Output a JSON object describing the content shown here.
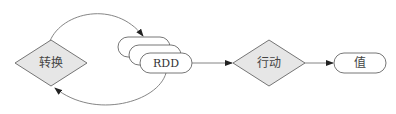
{
  "diagram": {
    "type": "flowchart",
    "nodes": {
      "transform": {
        "label": "转换",
        "shape": "diamond"
      },
      "rdd": {
        "label": "RDD",
        "shape": "stacked-pill"
      },
      "action": {
        "label": "行动",
        "shape": "diamond"
      },
      "value": {
        "label": "值",
        "shape": "pill"
      }
    },
    "edges": [
      {
        "from": "transform",
        "to": "rdd",
        "style": "curved-top"
      },
      {
        "from": "rdd",
        "to": "transform",
        "style": "curved-bottom"
      },
      {
        "from": "rdd",
        "to": "action",
        "style": "straight"
      },
      {
        "from": "action",
        "to": "value",
        "style": "straight"
      }
    ],
    "colors": {
      "diamond_fill": "#e6e6e6",
      "stroke": "#555555",
      "pill_fill": "#ffffff",
      "edge": "#666666"
    }
  }
}
